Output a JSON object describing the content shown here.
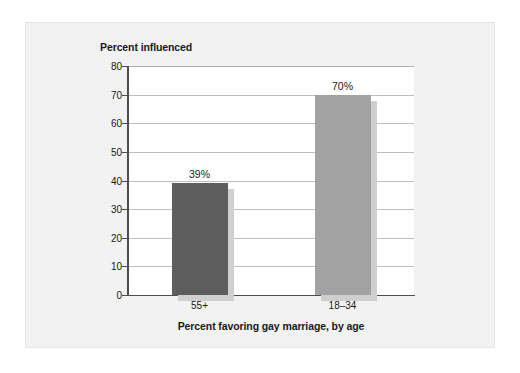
{
  "chart_data": {
    "type": "bar",
    "title": "",
    "subtitle": "",
    "xlabel": "Percent favoring gay marriage, by age",
    "ylabel": "Percent influenced",
    "categories": [
      "55+",
      "18–34"
    ],
    "values": [
      39,
      70
    ],
    "data_labels": [
      "39%",
      "70%"
    ],
    "ylim": [
      0,
      80
    ],
    "ytick_labels": [
      "0",
      "10",
      "20",
      "30",
      "40",
      "50",
      "60",
      "70",
      "80"
    ],
    "ytick_values": [
      0,
      10,
      20,
      30,
      40,
      50,
      60,
      70,
      80
    ],
    "grid": "horizontal",
    "legend": "none",
    "series": [
      {
        "name": "Percent influenced",
        "values": [
          39,
          70
        ],
        "bar_colors": [
          "#5d5d5d",
          "#a2a2a2"
        ],
        "shadow_color": "#cfcfcf"
      }
    ],
    "colors": {
      "bar_55plus": "#5d5d5d",
      "bar_18_34": "#a2a2a2",
      "bar_shadow": "#cfcfcf",
      "gridline": "#bfbfbf",
      "axis": "#4d4d4d",
      "plot_background": "#ffffff",
      "card_background": "#f2f2f2",
      "text": "#1a1a1a"
    }
  }
}
